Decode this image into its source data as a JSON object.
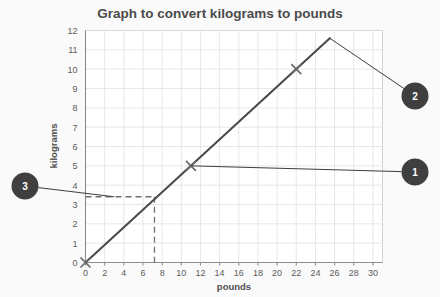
{
  "chart_data": {
    "type": "line",
    "title": "Graph to convert kilograms to pounds",
    "xlabel": "pounds",
    "ylabel": "kilograms",
    "xlim": [
      0,
      31
    ],
    "ylim": [
      0,
      12
    ],
    "xticks": [
      0,
      2,
      4,
      6,
      8,
      10,
      12,
      14,
      16,
      18,
      20,
      22,
      24,
      26,
      28,
      30
    ],
    "yticks": [
      0,
      1,
      2,
      3,
      4,
      5,
      6,
      7,
      8,
      9,
      10,
      11,
      12
    ],
    "grid": true,
    "legend": "none",
    "series": [
      {
        "name": "kilograms-to-pounds conversion line",
        "x": [
          0,
          25.5
        ],
        "y": [
          0,
          11.6
        ],
        "slope_kg_per_lb": 0.4545
      }
    ],
    "markers": [
      {
        "label": "origin",
        "x": 0,
        "y": 0,
        "symbol": "x"
      },
      {
        "label": "11 pounds = 5 kilograms",
        "x": 11,
        "y": 5,
        "symbol": "x"
      },
      {
        "label": "22 pounds = 10 kilograms",
        "x": 22,
        "y": 10,
        "symbol": "x"
      }
    ],
    "construction_lines": [
      {
        "name": "horizontal-read-off",
        "style": "dashed",
        "from": {
          "x": 0,
          "y": 3.4
        },
        "to": {
          "x": 7.2,
          "y": 3.4
        }
      },
      {
        "name": "vertical-read-off",
        "style": "dashed",
        "from": {
          "x": 7.2,
          "y": 3.4
        },
        "to": {
          "x": 7.2,
          "y": 0
        }
      }
    ],
    "annotations": [
      {
        "id": "1",
        "label": "1",
        "anchor": {
          "x": 11,
          "y": 5
        },
        "position": "right"
      },
      {
        "id": "2",
        "label": "2",
        "anchor": {
          "x": 25.5,
          "y": 11.6
        },
        "position": "right"
      },
      {
        "id": "3",
        "label": "3",
        "anchor": {
          "x": 3.0,
          "y": 3.4
        },
        "position": "left"
      }
    ]
  },
  "colors": {
    "background": "#fafafa",
    "plot_background": "#ffffff",
    "gridline": "#dcdcdc",
    "data_line": "#4a4a4a",
    "callout_fill": "#3f3f3f",
    "callout_text": "#ffffff",
    "title_text": "#4b4b4b",
    "tick_text": "#5a5a5a"
  }
}
